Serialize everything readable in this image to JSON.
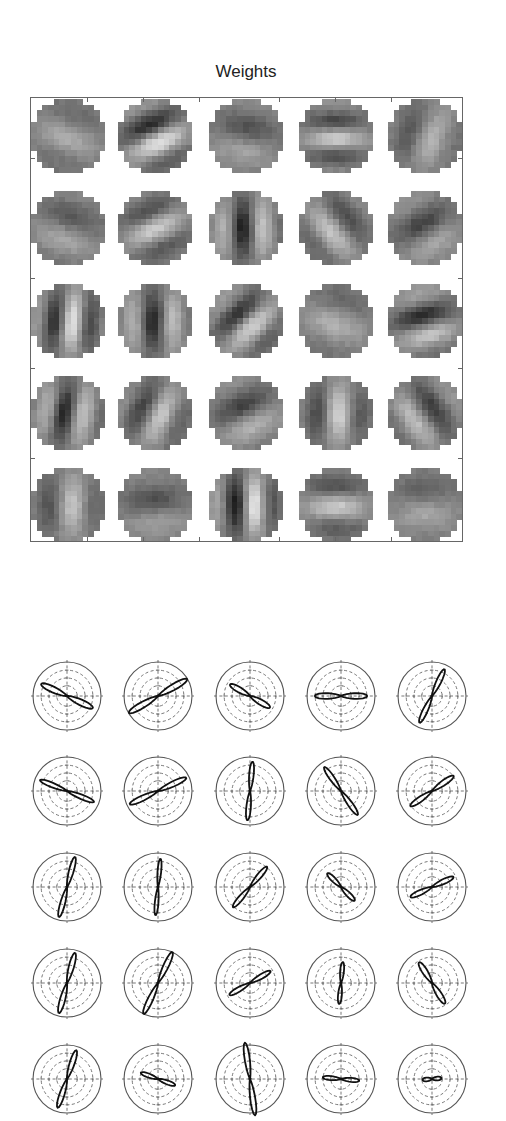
{
  "chart_data": [
    {
      "type": "heatmap",
      "title": "Weights",
      "description": "5x5 grid of learned circular receptive-field weight patches (13x13 pixels each, grayscale)",
      "grid": {
        "rows": 5,
        "cols": 5,
        "patch_pixels": 13
      },
      "colormap": "gray",
      "patches": [
        [
          {
            "angle": -20,
            "freq": 0.55,
            "phase": 0.3,
            "contrast": 0.35
          },
          {
            "angle": 25,
            "freq": 0.75,
            "phase": 1.2,
            "contrast": 0.85
          },
          {
            "angle": -10,
            "freq": 0.55,
            "phase": 2.0,
            "contrast": 0.4
          },
          {
            "angle": 0,
            "freq": 0.9,
            "phase": 0.5,
            "contrast": 0.6
          },
          {
            "angle": 70,
            "freq": 0.6,
            "phase": 1.0,
            "contrast": 0.45
          }
        ],
        [
          {
            "angle": -18,
            "freq": 0.6,
            "phase": 1.6,
            "contrast": 0.4
          },
          {
            "angle": 25,
            "freq": 0.75,
            "phase": 0.2,
            "contrast": 0.6
          },
          {
            "angle": 90,
            "freq": 0.8,
            "phase": 2.6,
            "contrast": 0.75
          },
          {
            "angle": -50,
            "freq": 0.7,
            "phase": 0.9,
            "contrast": 0.55
          },
          {
            "angle": 30,
            "freq": 0.6,
            "phase": 2.4,
            "contrast": 0.5
          }
        ],
        [
          {
            "angle": 85,
            "freq": 0.9,
            "phase": 0.8,
            "contrast": 0.8
          },
          {
            "angle": 90,
            "freq": 0.8,
            "phase": 2.8,
            "contrast": 0.7
          },
          {
            "angle": 45,
            "freq": 0.8,
            "phase": 1.4,
            "contrast": 0.7
          },
          {
            "angle": -20,
            "freq": 0.5,
            "phase": 0.5,
            "contrast": 0.4
          },
          {
            "angle": 15,
            "freq": 0.75,
            "phase": 2.2,
            "contrast": 0.7
          }
        ],
        [
          {
            "angle": 80,
            "freq": 0.85,
            "phase": 2.5,
            "contrast": 0.7
          },
          {
            "angle": 65,
            "freq": 0.75,
            "phase": 1.0,
            "contrast": 0.6
          },
          {
            "angle": 25,
            "freq": 0.6,
            "phase": 2.0,
            "contrast": 0.55
          },
          {
            "angle": 88,
            "freq": 0.7,
            "phase": 0.4,
            "contrast": 0.65
          },
          {
            "angle": -55,
            "freq": 0.7,
            "phase": 1.8,
            "contrast": 0.6
          }
        ],
        [
          {
            "angle": 88,
            "freq": 0.65,
            "phase": 0.6,
            "contrast": 0.55
          },
          {
            "angle": 5,
            "freq": 0.55,
            "phase": 2.3,
            "contrast": 0.4
          },
          {
            "angle": 90,
            "freq": 0.85,
            "phase": 1.4,
            "contrast": 0.9
          },
          {
            "angle": 0,
            "freq": 0.7,
            "phase": 0.3,
            "contrast": 0.6
          },
          {
            "angle": 2,
            "freq": 0.5,
            "phase": 1.2,
            "contrast": 0.35
          }
        ]
      ]
    },
    {
      "type": "polar",
      "title": "",
      "description": "5x5 grid of polar orientation-tuning plots; each shows a figure-8 lobe (bidirectional orientation response) inside concentric reference circles",
      "grid": {
        "rows": 5,
        "cols": 5
      },
      "rings": {
        "outer_solid": 1,
        "inner_dashed": 3
      },
      "crosshair": "dashed",
      "lobes": [
        [
          {
            "angle_deg": -25,
            "length": 0.82,
            "width": 0.16
          },
          {
            "angle_deg": 30,
            "length": 0.97,
            "width": 0.14
          },
          {
            "angle_deg": -30,
            "length": 0.66,
            "width": 0.18
          },
          {
            "angle_deg": 0,
            "length": 0.75,
            "width": 0.17
          },
          {
            "angle_deg": 65,
            "length": 0.85,
            "width": 0.13
          }
        ],
        [
          {
            "angle_deg": -22,
            "length": 0.84,
            "width": 0.12
          },
          {
            "angle_deg": 25,
            "length": 0.9,
            "width": 0.13
          },
          {
            "angle_deg": 85,
            "length": 0.85,
            "width": 0.12
          },
          {
            "angle_deg": -55,
            "length": 0.84,
            "width": 0.13
          },
          {
            "angle_deg": 35,
            "length": 0.76,
            "width": 0.15
          }
        ],
        [
          {
            "angle_deg": 75,
            "length": 0.9,
            "width": 0.12
          },
          {
            "angle_deg": 85,
            "length": 0.82,
            "width": 0.1
          },
          {
            "angle_deg": 50,
            "length": 0.76,
            "width": 0.14
          },
          {
            "angle_deg": -45,
            "length": 0.55,
            "width": 0.18
          },
          {
            "angle_deg": 25,
            "length": 0.68,
            "width": 0.16
          }
        ],
        [
          {
            "angle_deg": 75,
            "length": 0.9,
            "width": 0.13
          },
          {
            "angle_deg": 65,
            "length": 0.99,
            "width": 0.12
          },
          {
            "angle_deg": 30,
            "length": 0.68,
            "width": 0.15
          },
          {
            "angle_deg": 85,
            "length": 0.6,
            "width": 0.14
          },
          {
            "angle_deg": -58,
            "length": 0.7,
            "width": 0.17
          }
        ],
        [
          {
            "angle_deg": 72,
            "length": 0.87,
            "width": 0.13
          },
          {
            "angle_deg": -20,
            "length": 0.52,
            "width": 0.17
          },
          {
            "angle_deg": 98,
            "length": 1.06,
            "width": 0.11
          },
          {
            "angle_deg": -5,
            "length": 0.52,
            "width": 0.17
          },
          {
            "angle_deg": 5,
            "length": 0.26,
            "width": 0.3
          }
        ]
      ]
    }
  ],
  "header": {
    "title": "Weights"
  },
  "layout": {
    "weights_patch_centers_x": [
      37,
      124,
      215,
      305,
      394
    ],
    "weights_patch_centers_y": [
      38,
      130,
      223,
      315,
      407
    ],
    "polar_centers_x": [
      67,
      158,
      250,
      341,
      432
    ],
    "polar_centers_y": [
      96,
      191,
      287,
      383,
      479
    ],
    "polar_radius": 34
  },
  "colors": {
    "frame": "#666666",
    "lobe": "#111111",
    "ring": "#555555",
    "dashed": "#666666",
    "patch_mid_gray": "#7f7f7f"
  }
}
